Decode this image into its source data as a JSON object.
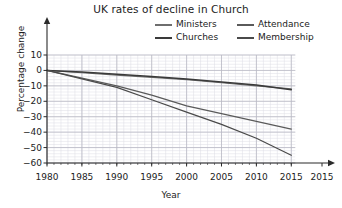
{
  "chart_data": {
    "type": "line",
    "title": "UK rates of decline in Church",
    "xlabel": "Year",
    "ylabel": "Percentage change",
    "xlim": [
      1980,
      2015
    ],
    "ylim": [
      -60,
      10
    ],
    "grid": true,
    "legend_position": "top-right",
    "xticks": [
      "1980",
      "1985",
      "1990",
      "1995",
      "2000",
      "2005",
      "2010",
      "2015",
      "2015"
    ],
    "xtick_values": [
      1980,
      1985,
      1990,
      1995,
      2000,
      2005,
      2010,
      2015,
      2019.4
    ],
    "yticks": [
      "10",
      "0",
      "-10",
      "-20",
      "-30",
      "-40",
      "-50",
      "-60"
    ],
    "ytick_values": [
      10,
      0,
      -10,
      -20,
      -30,
      -40,
      -50,
      -60
    ],
    "x": [
      1980,
      1985,
      1990,
      1995,
      2000,
      2005,
      2010,
      2015
    ],
    "series": [
      {
        "name": "Ministers",
        "color": "#6e6e6e",
        "values": [
          0,
          -1.5,
          -3,
          -4.5,
          -6,
          -8,
          -10,
          -12
        ]
      },
      {
        "name": "Churches",
        "color": "#3a3a3a",
        "values": [
          0,
          -1,
          -2.5,
          -4,
          -5.5,
          -7.5,
          -9.5,
          -12.5
        ]
      },
      {
        "name": "Attendance",
        "color": "#5a5a5a",
        "values": [
          0,
          -5,
          -10,
          -16,
          -23,
          -28,
          -33,
          -38
        ]
      },
      {
        "name": "Membership",
        "color": "#4a4a4a",
        "values": [
          0,
          -5.5,
          -11,
          -19,
          -27,
          -35,
          -44,
          -55
        ]
      }
    ]
  },
  "axis": {
    "line_color": "#2b2b2b",
    "grid_major_color": "#b9b9c4",
    "grid_minor_color": "#dcdce4"
  }
}
